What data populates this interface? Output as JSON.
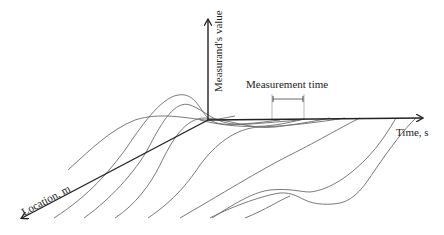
{
  "diagram": {
    "axes": {
      "vertical_label": "Measurand's value",
      "horizontal_label": "Time, s",
      "depth_label": "Location, m"
    },
    "annotation": {
      "measurement_time_label": "Measurement time"
    },
    "colors": {
      "axis": "#222222",
      "curve": "#6a6a6a",
      "background": "#ffffff"
    }
  }
}
